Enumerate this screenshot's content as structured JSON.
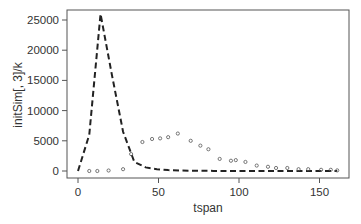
{
  "chart_data": {
    "type": "line",
    "title": "",
    "xlabel": "tspan",
    "ylabel": "initSim[, 3]/k",
    "xlim": [
      -6,
      166
    ],
    "ylim": [
      -1000,
      26000
    ],
    "x_ticks": [
      0,
      50,
      100,
      150
    ],
    "y_ticks": [
      0,
      5000,
      10000,
      15000,
      20000,
      25000
    ],
    "grid": false,
    "legend": null,
    "series": [
      {
        "name": "model",
        "style": "dashed-line",
        "color": "#222222",
        "x": [
          0,
          7,
          14,
          21,
          28,
          35,
          42,
          49,
          56,
          63,
          70,
          77,
          84,
          91,
          98,
          105,
          112,
          119,
          126,
          133,
          140,
          147,
          154,
          161
        ],
        "y": [
          0,
          6000,
          26000,
          16000,
          6500,
          1500,
          600,
          300,
          150,
          80,
          50,
          30,
          20,
          15,
          10,
          10,
          5,
          5,
          5,
          5,
          5,
          5,
          5,
          5
        ]
      },
      {
        "name": "observed",
        "style": "open-circles",
        "color": "#555555",
        "x": [
          7,
          12,
          19,
          28,
          33,
          40,
          46,
          51,
          56,
          62,
          70,
          76,
          81,
          88,
          95,
          98,
          104,
          111,
          118,
          123,
          130,
          137,
          143,
          151,
          157,
          161
        ],
        "y": [
          0,
          0,
          80,
          300,
          2800,
          4800,
          5300,
          5400,
          5600,
          6200,
          5000,
          4200,
          3600,
          2000,
          1700,
          1800,
          1500,
          900,
          700,
          500,
          500,
          300,
          300,
          200,
          200,
          100
        ]
      }
    ]
  }
}
